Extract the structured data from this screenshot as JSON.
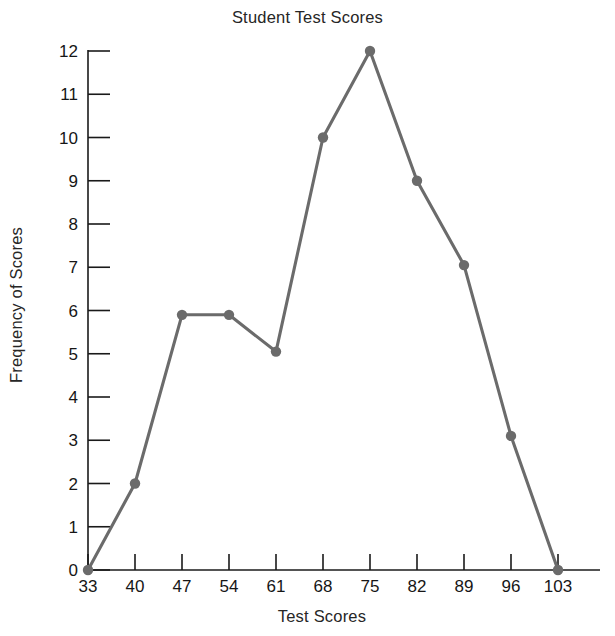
{
  "chart_data": {
    "type": "line",
    "title": "Student Test Scores",
    "xlabel": "Test Scores",
    "ylabel": "Frequency of Scores",
    "x": [
      33,
      40,
      47,
      54,
      61,
      68,
      75,
      82,
      89,
      96,
      103
    ],
    "values": [
      0,
      2,
      5.9,
      5.9,
      5.05,
      10,
      12,
      9,
      7.05,
      3.1,
      0
    ],
    "xtick_labels": [
      "33",
      "40",
      "47",
      "54",
      "61",
      "68",
      "75",
      "82",
      "89",
      "96",
      "103"
    ],
    "ytick_labels": [
      "0",
      "1",
      "2",
      "3",
      "4",
      "5",
      "6",
      "7",
      "8",
      "9",
      "10",
      "11",
      "12"
    ],
    "yticks": [
      0,
      1,
      2,
      3,
      4,
      5,
      6,
      7,
      8,
      9,
      10,
      11,
      12
    ],
    "xlim": [
      33,
      103
    ],
    "ylim": [
      0,
      12
    ],
    "grid": false,
    "legend": "none",
    "series_color": "#6b6b6b",
    "marker": "circle",
    "marker_color": "#6b6b6b",
    "axis_color": "#1a1a1a"
  }
}
